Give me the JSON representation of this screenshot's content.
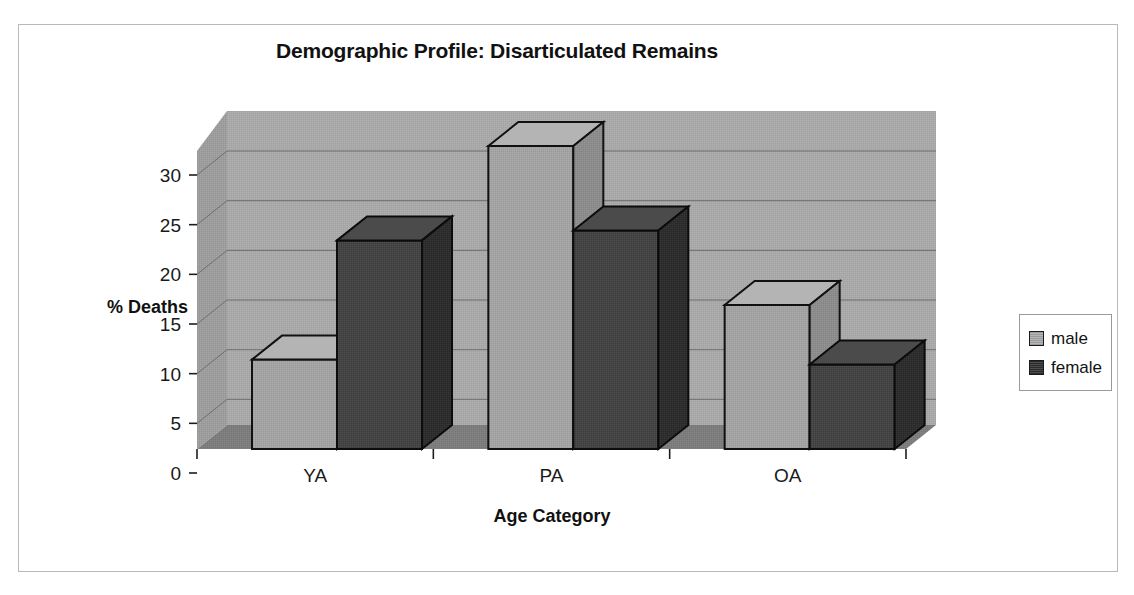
{
  "chart_data": {
    "type": "bar",
    "title": "Demographic Profile: Disarticulated Remains",
    "xlabel": "Age Category",
    "ylabel": "% Deaths",
    "categories": [
      "YA",
      "PA",
      "OA"
    ],
    "series": [
      {
        "name": "male",
        "color": "#a0a0a0",
        "values": [
          9,
          30.5,
          14.5
        ]
      },
      {
        "name": "female",
        "color": "#404040",
        "values": [
          21,
          22,
          8.5
        ]
      }
    ],
    "ylim": [
      0,
      30
    ],
    "yticks": [
      "0",
      "5",
      "10",
      "15",
      "20",
      "25",
      "30"
    ],
    "ytick_values": [
      0,
      5,
      10,
      15,
      20,
      25,
      30
    ],
    "grid": true,
    "legend_position": "right",
    "style": "3d-column",
    "plot_background": "#a8a8a8",
    "floor_color": "#7b7b7b",
    "sidewall_color": "#9a9a9a"
  },
  "legend": {
    "entries": [
      {
        "label": "male",
        "swatch": "#a0a0a0"
      },
      {
        "label": "female",
        "swatch": "#3d3d3d"
      }
    ]
  }
}
